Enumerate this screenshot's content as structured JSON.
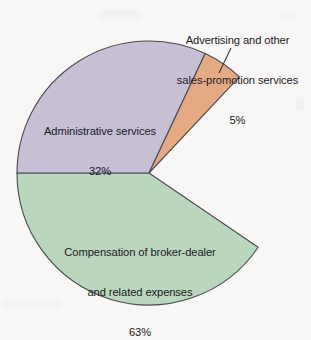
{
  "chart_data": {
    "type": "pie",
    "title": "",
    "subtitle": "",
    "xlabel": "",
    "ylabel": "",
    "legend_position": "none",
    "grid": false,
    "units": "percent",
    "categories": [
      "Compensation of broker-dealer and related expenses",
      "Administrative services",
      "Advertising and other sales-promotion services"
    ],
    "values": [
      63,
      32,
      5
    ],
    "slices": [
      {
        "name": "compensation",
        "label_lines": [
          "Compensation of broker-dealer",
          "and related expenses",
          "63%"
        ],
        "value": 63,
        "value_text": "63%",
        "color": "#bad6bd",
        "start_angle_deg": -34.2,
        "end_angle_deg": 180.0,
        "label_placement": "inside"
      },
      {
        "name": "administrative",
        "label_lines": [
          "Administrative services",
          "32%"
        ],
        "value": 32,
        "value_text": "32%",
        "color": "#c7bfd3",
        "start_angle_deg": 180.0,
        "end_angle_deg": 64.8,
        "label_placement": "inside"
      },
      {
        "name": "advertising",
        "label_lines": [
          "Advertising and other",
          "sales-promotion services",
          "5%"
        ],
        "value": 5,
        "value_text": "5%",
        "color": "#e4aa84",
        "start_angle_deg": 64.8,
        "end_angle_deg": 46.8,
        "label_placement": "outside-with-leader"
      }
    ],
    "geometry": {
      "center_x": 149,
      "center_y": 173,
      "radius": 132,
      "leader_line": {
        "x1": 231,
        "y1": 48,
        "x2": 219,
        "y2": 73
      }
    },
    "colors": {
      "background": "#f8f7f5",
      "outline": "#4a4a52",
      "text": "#1b1b1f",
      "green": "#bad6bd",
      "purple": "#c7bfd3",
      "orange": "#e4aa84"
    }
  },
  "labels": {
    "advertising": {
      "line1": "Advertising and other",
      "line2": "sales-promotion services",
      "line3": "5%"
    },
    "administrative": {
      "line1": "Administrative services",
      "line2": "32%"
    },
    "compensation": {
      "line1": "Compensation of broker-dealer",
      "line2": "and related expenses",
      "line3": "63%"
    }
  }
}
